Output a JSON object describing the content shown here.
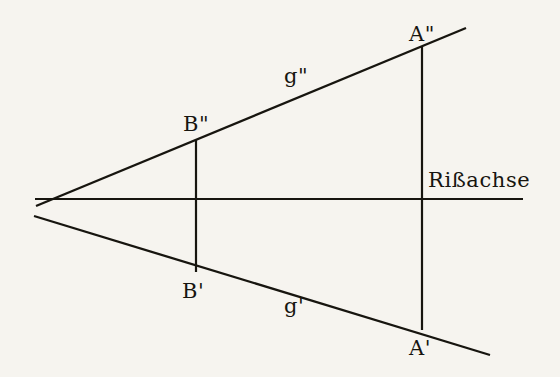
{
  "figure": {
    "background_color": "#f6f4ef",
    "ink_color": "#17150f",
    "width": 560,
    "height": 377
  },
  "labels": {
    "axis": "Rißachse",
    "point_a_second": "A\"",
    "point_b_second": "B\"",
    "point_b_first": "B'",
    "point_a_first": "A'",
    "line_g_second": "g\"",
    "line_g_first": "g'"
  },
  "chart_data": {
    "type": "scatter",
    "xlabel": "",
    "ylabel": "",
    "grid": false,
    "legend": "none",
    "xlim": [
      0,
      560
    ],
    "ylim": [
      377,
      0
    ],
    "axis_line": {
      "name": "Rißachse",
      "label": "Rißachse",
      "x1": 35,
      "y1": 199,
      "x2": 523,
      "y2": 199
    },
    "lines": [
      {
        "name": "g\"",
        "label": "g\"",
        "description": "upper projection (Aufriss) of line g",
        "x1": 36,
        "y1": 206,
        "x2": 466,
        "y2": 28,
        "label_x": 296,
        "label_y": 78
      },
      {
        "name": "g'",
        "label": "g'",
        "description": "lower projection (Grundriss) of line g",
        "x1": 34,
        "y1": 216,
        "x2": 490,
        "y2": 355,
        "label_x": 296,
        "label_y": 308
      }
    ],
    "points": [
      {
        "label": "A\"",
        "x": 422,
        "y": 46,
        "on_line": "g\""
      },
      {
        "label": "B\"",
        "x": 196,
        "y": 140,
        "on_line": "g\""
      },
      {
        "label": "B'",
        "x": 196,
        "y": 272,
        "on_line": "g'"
      },
      {
        "label": "A'",
        "x": 422,
        "y": 330,
        "on_line": "g'"
      }
    ],
    "projectors": [
      {
        "name": "projector-B",
        "x": 196,
        "y1": 140,
        "y2": 272
      },
      {
        "name": "projector-A",
        "x": 422,
        "y1": 46,
        "y2": 330
      }
    ],
    "apex": {
      "x": 50,
      "y": 199,
      "description": "g' and g\" intersect the Rißachse at the trace point"
    }
  }
}
